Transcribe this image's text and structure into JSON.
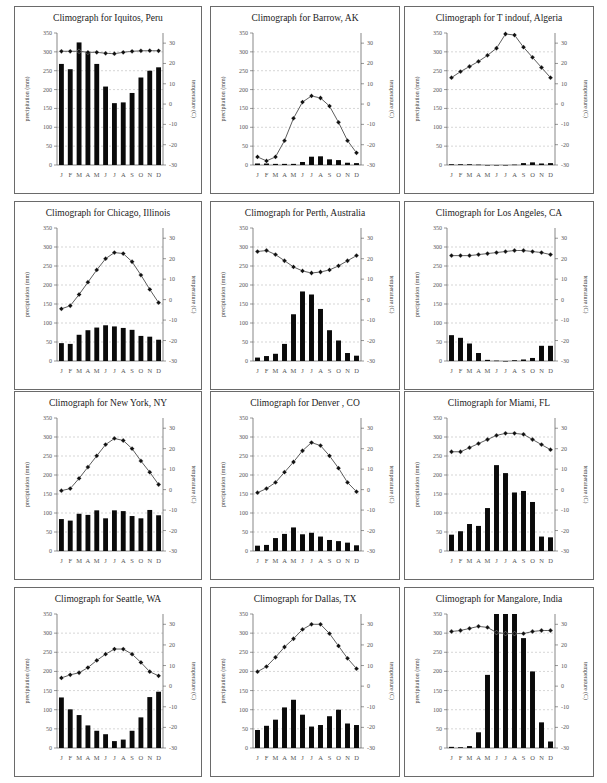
{
  "page": {
    "layout": "4 rows x 3 columns of climographs"
  },
  "colors": {
    "bar": "#0a0a0a",
    "line": "#333333",
    "marker": "#111111",
    "grid": "#bbbbbb",
    "border": "#6a6a6a"
  },
  "axes": {
    "months": [
      "J",
      "F",
      "M",
      "A",
      "M",
      "J",
      "J",
      "A",
      "S",
      "O",
      "N",
      "D"
    ],
    "left_label": "precipitation (mm)",
    "right_label": "temperature (C)",
    "left_ticks": [
      0,
      50,
      100,
      150,
      200,
      250,
      300,
      350
    ],
    "right_ticks": [
      -30,
      -20,
      -10,
      0,
      10,
      20,
      30
    ]
  },
  "chart_data": [
    {
      "type": "bar+line",
      "title": "Climograph for Iquitos, Peru",
      "categories": [
        "J",
        "F",
        "M",
        "A",
        "M",
        "J",
        "J",
        "A",
        "S",
        "O",
        "N",
        "D"
      ],
      "series": [
        {
          "name": "precipitation (mm)",
          "axis": "left",
          "type": "bar",
          "values": [
            268,
            254,
            325,
            300,
            268,
            208,
            164,
            166,
            191,
            232,
            250,
            259
          ]
        },
        {
          "name": "temperature (C)",
          "axis": "right",
          "type": "line",
          "values": [
            26,
            26,
            26,
            25.5,
            25.5,
            25,
            24.8,
            25.5,
            26,
            26.2,
            26.3,
            26.2
          ]
        }
      ],
      "ylim_left": [
        0,
        350
      ],
      "ylim_right": [
        -30,
        35
      ],
      "grid": true
    },
    {
      "type": "bar+line",
      "title": "Climograph for Barrow, AK",
      "categories": [
        "J",
        "F",
        "M",
        "A",
        "M",
        "J",
        "J",
        "A",
        "S",
        "O",
        "N",
        "D"
      ],
      "series": [
        {
          "name": "precipitation (mm)",
          "axis": "left",
          "type": "bar",
          "values": [
            4,
            4,
            3,
            3,
            3,
            8,
            22,
            23,
            15,
            13,
            6,
            5
          ]
        },
        {
          "name": "temperature (C)",
          "axis": "right",
          "type": "line",
          "values": [
            -26,
            -28,
            -26,
            -18,
            -7,
            1,
            4,
            3,
            -1,
            -9,
            -18,
            -24
          ]
        }
      ],
      "ylim_left": [
        0,
        350
      ],
      "ylim_right": [
        -30,
        35
      ],
      "grid": true
    },
    {
      "type": "bar+line",
      "title": "Climograph for T indouf, Algeria",
      "categories": [
        "J",
        "F",
        "M",
        "A",
        "M",
        "J",
        "J",
        "A",
        "S",
        "O",
        "N",
        "D"
      ],
      "series": [
        {
          "name": "precipitation (mm)",
          "axis": "left",
          "type": "bar",
          "values": [
            2,
            2,
            2,
            1,
            0,
            0,
            0,
            1,
            5,
            7,
            4,
            5
          ]
        },
        {
          "name": "temperature (C)",
          "axis": "right",
          "type": "line",
          "values": [
            13,
            16,
            18.5,
            21,
            24,
            27.5,
            34.5,
            34,
            28,
            23,
            18,
            13
          ]
        }
      ],
      "ylim_left": [
        0,
        350
      ],
      "ylim_right": [
        -30,
        35
      ],
      "grid": true
    },
    {
      "type": "bar+line",
      "title": "Climograph for Chicago, Illinois",
      "categories": [
        "J",
        "F",
        "M",
        "A",
        "M",
        "J",
        "J",
        "A",
        "S",
        "O",
        "N",
        "D"
      ],
      "series": [
        {
          "name": "precipitation (mm)",
          "axis": "left",
          "type": "bar",
          "values": [
            47,
            45,
            69,
            81,
            88,
            94,
            91,
            87,
            82,
            66,
            64,
            56
          ]
        },
        {
          "name": "temperature (C)",
          "axis": "right",
          "type": "line",
          "values": [
            -4.5,
            -3,
            2.5,
            8.5,
            14.5,
            20,
            23,
            22.5,
            18.5,
            12,
            5,
            -1.5
          ]
        }
      ],
      "ylim_left": [
        0,
        350
      ],
      "ylim_right": [
        -30,
        35
      ],
      "grid": true
    },
    {
      "type": "bar+line",
      "title": "Climograph for Perth, Australia",
      "categories": [
        "J",
        "F",
        "M",
        "A",
        "M",
        "J",
        "J",
        "A",
        "S",
        "O",
        "N",
        "D"
      ],
      "series": [
        {
          "name": "precipitation (mm)",
          "axis": "left",
          "type": "bar",
          "values": [
            9,
            13,
            19,
            45,
            123,
            183,
            175,
            137,
            81,
            54,
            21,
            14
          ]
        },
        {
          "name": "temperature (C)",
          "axis": "right",
          "type": "line",
          "values": [
            23.5,
            24,
            22,
            19,
            16,
            14,
            13,
            13.5,
            14.5,
            16.5,
            19,
            21.5
          ]
        }
      ],
      "ylim_left": [
        0,
        350
      ],
      "ylim_right": [
        -30,
        35
      ],
      "grid": true
    },
    {
      "type": "bar+line",
      "title": "Climograph for Los Angeles, CA",
      "categories": [
        "J",
        "F",
        "M",
        "A",
        "M",
        "J",
        "J",
        "A",
        "S",
        "O",
        "N",
        "D"
      ],
      "series": [
        {
          "name": "precipitation (mm)",
          "axis": "left",
          "type": "bar",
          "values": [
            68,
            61,
            46,
            21,
            3,
            1,
            0,
            2,
            4,
            8,
            40,
            40
          ]
        },
        {
          "name": "temperature (C)",
          "axis": "right",
          "type": "line",
          "values": [
            21.5,
            21.5,
            21.5,
            22,
            22.5,
            23,
            23.5,
            24,
            24,
            23.5,
            23,
            22
          ]
        }
      ],
      "ylim_left": [
        0,
        350
      ],
      "ylim_right": [
        -30,
        35
      ],
      "grid": true
    },
    {
      "type": "bar+line",
      "title": "Climograph for New York, NY",
      "categories": [
        "J",
        "F",
        "M",
        "A",
        "M",
        "J",
        "J",
        "A",
        "S",
        "O",
        "N",
        "D"
      ],
      "series": [
        {
          "name": "precipitation (mm)",
          "axis": "left",
          "type": "bar",
          "values": [
            84,
            80,
            98,
            95,
            107,
            86,
            107,
            105,
            92,
            86,
            108,
            94
          ]
        },
        {
          "name": "temperature (C)",
          "axis": "right",
          "type": "line",
          "values": [
            -0.5,
            0.5,
            5.5,
            11,
            16.5,
            22,
            25,
            24,
            20,
            14,
            8.5,
            2.5
          ]
        }
      ],
      "ylim_left": [
        0,
        350
      ],
      "ylim_right": [
        -30,
        35
      ],
      "grid": true
    },
    {
      "type": "bar+line",
      "title": "Climograph for Denver , CO",
      "categories": [
        "J",
        "F",
        "M",
        "A",
        "M",
        "J",
        "J",
        "A",
        "S",
        "O",
        "N",
        "D"
      ],
      "series": [
        {
          "name": "precipitation (mm)",
          "axis": "left",
          "type": "bar",
          "values": [
            14,
            16,
            34,
            45,
            62,
            44,
            48,
            38,
            29,
            26,
            22,
            15
          ]
        },
        {
          "name": "temperature (C)",
          "axis": "right",
          "type": "line",
          "values": [
            -1.5,
            0.5,
            3.5,
            8.5,
            13.5,
            19,
            23,
            21.5,
            16.5,
            10.5,
            3.5,
            -1
          ]
        }
      ],
      "ylim_left": [
        0,
        350
      ],
      "ylim_right": [
        -30,
        35
      ],
      "grid": true
    },
    {
      "type": "bar+line",
      "title": "Climograph for Miami, FL",
      "categories": [
        "J",
        "F",
        "M",
        "A",
        "M",
        "J",
        "J",
        "A",
        "S",
        "O",
        "N",
        "D"
      ],
      "series": [
        {
          "name": "precipitation (mm)",
          "axis": "left",
          "type": "bar",
          "values": [
            43,
            52,
            71,
            66,
            113,
            226,
            205,
            154,
            158,
            129,
            38,
            36
          ]
        },
        {
          "name": "temperature (C)",
          "axis": "right",
          "type": "line",
          "values": [
            18.5,
            18.5,
            20.5,
            22.5,
            24.5,
            26.5,
            27.5,
            27.5,
            27,
            24.5,
            22,
            19.5
          ]
        }
      ],
      "ylim_left": [
        0,
        350
      ],
      "ylim_right": [
        -30,
        35
      ],
      "grid": true
    },
    {
      "type": "bar+line",
      "title": "Climograph for Seattle, WA",
      "categories": [
        "J",
        "F",
        "M",
        "A",
        "M",
        "J",
        "J",
        "A",
        "S",
        "O",
        "N",
        "D"
      ],
      "series": [
        {
          "name": "precipitation (mm)",
          "axis": "left",
          "type": "bar",
          "values": [
            132,
            101,
            86,
            59,
            45,
            36,
            18,
            22,
            45,
            80,
            133,
            147
          ]
        },
        {
          "name": "temperature (C)",
          "axis": "right",
          "type": "line",
          "values": [
            4,
            5.5,
            6.5,
            9,
            12.5,
            15.5,
            18,
            18,
            15.5,
            11.5,
            7,
            5
          ]
        }
      ],
      "ylim_left": [
        0,
        350
      ],
      "ylim_right": [
        -30,
        35
      ],
      "grid": true
    },
    {
      "type": "bar+line",
      "title": "Climograph for Dallas, TX",
      "categories": [
        "J",
        "F",
        "M",
        "A",
        "M",
        "J",
        "J",
        "A",
        "S",
        "O",
        "N",
        "D"
      ],
      "series": [
        {
          "name": "precipitation (mm)",
          "axis": "left",
          "type": "bar",
          "values": [
            47,
            58,
            74,
            106,
            126,
            87,
            56,
            60,
            83,
            100,
            64,
            60
          ]
        },
        {
          "name": "temperature (C)",
          "axis": "right",
          "type": "line",
          "values": [
            7,
            9.5,
            14,
            19,
            23,
            27.5,
            30,
            30,
            25.5,
            19.5,
            13.5,
            8.5
          ]
        }
      ],
      "ylim_left": [
        0,
        350
      ],
      "ylim_right": [
        -30,
        35
      ],
      "grid": true
    },
    {
      "type": "bar+line",
      "title": "Climograph for Mangalore, India",
      "categories": [
        "J",
        "F",
        "M",
        "A",
        "M",
        "J",
        "J",
        "A",
        "S",
        "O",
        "N",
        "D"
      ],
      "series": [
        {
          "name": "precipitation (mm)",
          "axis": "left",
          "type": "bar",
          "values": [
            3,
            2,
            5,
            41,
            191,
            350,
            350,
            350,
            287,
            200,
            67,
            17
          ],
          "note": "Jun-Aug bars clipped at 350"
        },
        {
          "name": "temperature (C)",
          "axis": "right",
          "type": "line",
          "values": [
            26.5,
            27,
            28,
            29,
            28.5,
            26,
            25.5,
            25.5,
            25.5,
            26.5,
            27,
            27
          ]
        }
      ],
      "ylim_left": [
        0,
        350
      ],
      "ylim_right": [
        -30,
        35
      ],
      "grid": true
    }
  ]
}
